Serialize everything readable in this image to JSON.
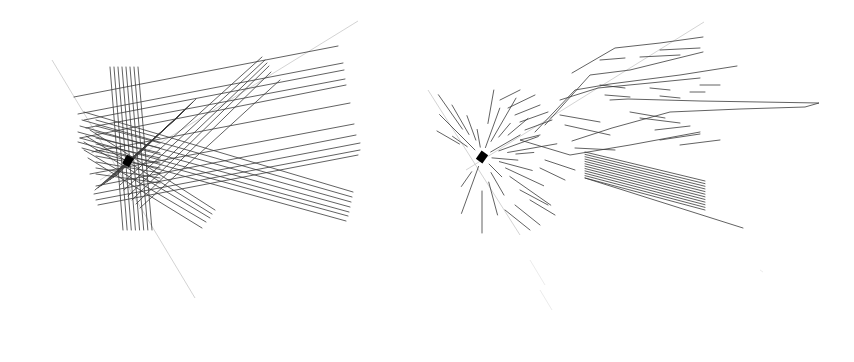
{
  "figure": {
    "width": 854,
    "height": 362,
    "background": "#ffffff",
    "line_color": "#3a3a3a",
    "faint_line_color": "#c8c8c8",
    "panels": [
      {
        "id": "left",
        "description": "Dense bundle of straight rays crossing at a central dark node",
        "node": {
          "x": 128,
          "y": 161
        },
        "faint_lines": [
          [
            52,
            60,
            195,
            298
          ],
          [
            100,
            180,
            358,
            21
          ]
        ],
        "vertical_bundle": {
          "count": 8,
          "top_y": 67,
          "top_x_start": 110,
          "top_x_end": 138,
          "bottom_y": 230,
          "bottom_x_start": 123,
          "bottom_x_end": 152
        },
        "upper_right_fan": [
          [
            74,
            97,
            338,
            46
          ],
          [
            78,
            114,
            343,
            63
          ],
          [
            84,
            120,
            344,
            70
          ],
          [
            86,
            128,
            345,
            79
          ],
          [
            80,
            138,
            346,
            85
          ],
          [
            92,
            152,
            350,
            103
          ],
          [
            90,
            174,
            354,
            124
          ],
          [
            96,
            186,
            356,
            135
          ],
          [
            94,
            194,
            360,
            143
          ],
          [
            96,
            200,
            360,
            150
          ],
          [
            98,
            205,
            358,
            155
          ]
        ],
        "diagonal_up_bundle": [
          [
            120,
            185,
            262,
            57
          ],
          [
            124,
            190,
            265,
            60
          ],
          [
            128,
            196,
            267,
            63
          ],
          [
            132,
            200,
            269,
            66
          ],
          [
            136,
            204,
            271,
            72
          ],
          [
            140,
            208,
            280,
            80
          ]
        ],
        "lower_right_bundle": [
          [
            84,
            112,
            353,
            192
          ],
          [
            82,
            120,
            352,
            197
          ],
          [
            80,
            126,
            351,
            202
          ],
          [
            78,
            132,
            350,
            207
          ],
          [
            80,
            138,
            349,
            212
          ],
          [
            78,
            142,
            348,
            216
          ],
          [
            82,
            148,
            346,
            221
          ]
        ],
        "lower_short_bundle": [
          [
            90,
            130,
            215,
            210
          ],
          [
            86,
            136,
            212,
            214
          ],
          [
            84,
            142,
            210,
            218
          ],
          [
            84,
            150,
            206,
            222
          ],
          [
            88,
            158,
            202,
            228
          ]
        ]
      },
      {
        "id": "right",
        "description": "Fragmented segments flowing from a dark node toward the upper right",
        "node": {
          "x": 482,
          "y": 157
        },
        "faint_lines": [
          [
            428,
            90,
            520,
            235
          ],
          [
            466,
            170,
            704,
            22
          ]
        ],
        "long_polyline_top": [
          [
            570,
            78
          ],
          [
            617,
            46
          ],
          [
            670,
            40
          ],
          [
            703,
            36
          ]
        ],
        "long_polyline_mid": [
          [
            560,
            100
          ],
          [
            602,
            69
          ],
          [
            640,
            63
          ],
          [
            702,
            52
          ]
        ],
        "spike_polyline": [
          [
            610,
            100
          ],
          [
            628,
            99
          ],
          [
            700,
            101
          ],
          [
            819,
            103
          ],
          [
            805,
            107
          ],
          [
            740,
            109
          ],
          [
            670,
            112
          ],
          [
            612,
            128
          ],
          [
            572,
            141
          ]
        ],
        "parallel_block": {
          "count": 12,
          "x_start": 585,
          "x_end": 705,
          "y_top_start": 152,
          "y_top_end": 181,
          "y_bottom_start": 178,
          "y_bottom_end": 210
        },
        "tail_line": [
          585,
          178,
          743,
          228
        ]
      }
    ]
  }
}
